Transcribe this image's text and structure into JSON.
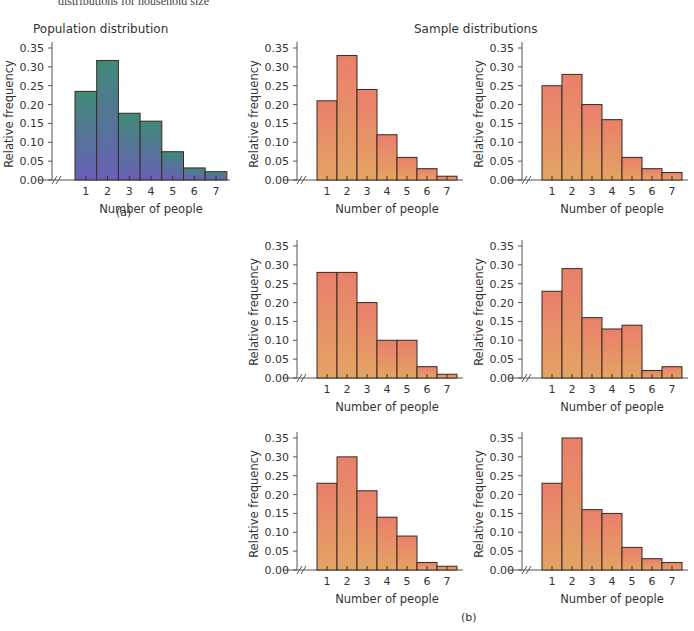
{
  "header": {
    "caption_fragment": "distributions for household size",
    "population_title": "Population distribution",
    "sample_title": "Sample distributions",
    "label_a": "(a)",
    "label_b": "(b)"
  },
  "colors": {
    "population_top": "#3f8a78",
    "population_bottom": "#6a5fb8",
    "sample_top": "#ea7f6c",
    "sample_bottom": "#e3a463",
    "bar_stroke": "#3a2a22",
    "axis": "#555555"
  },
  "chart_data": [
    {
      "id": "population",
      "type": "bar",
      "title": "Population distribution",
      "xlabel": "Number of people",
      "ylabel": "Relative frequency",
      "categories": [
        "1",
        "2",
        "3",
        "4",
        "5",
        "6",
        "7"
      ],
      "values": [
        0.235,
        0.317,
        0.177,
        0.156,
        0.075,
        0.032,
        0.022
      ],
      "yticks": [
        "0.00",
        "0.05",
        "0.10",
        "0.15",
        "0.20",
        "0.25",
        "0.30",
        "0.35"
      ],
      "ylim": [
        0,
        0.35
      ],
      "grid": false,
      "axis_break": true
    },
    {
      "id": "sample-1",
      "type": "bar",
      "xlabel": "Number of people",
      "ylabel": "Relative frequency",
      "categories": [
        "1",
        "2",
        "3",
        "4",
        "5",
        "6",
        "7"
      ],
      "values": [
        0.21,
        0.33,
        0.24,
        0.12,
        0.06,
        0.03,
        0.01
      ],
      "yticks": [
        "0.00",
        "0.05",
        "0.10",
        "0.15",
        "0.20",
        "0.25",
        "0.30",
        "0.35"
      ],
      "ylim": [
        0,
        0.35
      ],
      "grid": false,
      "axis_break": true
    },
    {
      "id": "sample-2",
      "type": "bar",
      "xlabel": "Number of people",
      "ylabel": "Relative frequency",
      "categories": [
        "1",
        "2",
        "3",
        "4",
        "5",
        "6",
        "7"
      ],
      "values": [
        0.25,
        0.28,
        0.2,
        0.16,
        0.06,
        0.03,
        0.02
      ],
      "yticks": [
        "0.00",
        "0.05",
        "0.10",
        "0.15",
        "0.20",
        "0.25",
        "0.30",
        "0.35"
      ],
      "ylim": [
        0,
        0.35
      ],
      "grid": false,
      "axis_break": true
    },
    {
      "id": "sample-3",
      "type": "bar",
      "xlabel": "Number of people",
      "ylabel": "Relative frequency",
      "categories": [
        "1",
        "2",
        "3",
        "4",
        "5",
        "6",
        "7"
      ],
      "values": [
        0.28,
        0.28,
        0.2,
        0.1,
        0.1,
        0.03,
        0.01
      ],
      "yticks": [
        "0.00",
        "0.05",
        "0.10",
        "0.15",
        "0.20",
        "0.25",
        "0.30",
        "0.35"
      ],
      "ylim": [
        0,
        0.35
      ],
      "grid": false,
      "axis_break": true
    },
    {
      "id": "sample-4",
      "type": "bar",
      "xlabel": "Number of people",
      "ylabel": "Relative frequency",
      "categories": [
        "1",
        "2",
        "3",
        "4",
        "5",
        "6",
        "7"
      ],
      "values": [
        0.23,
        0.29,
        0.16,
        0.13,
        0.14,
        0.02,
        0.03
      ],
      "yticks": [
        "0.00",
        "0.05",
        "0.10",
        "0.15",
        "0.20",
        "0.25",
        "0.30",
        "0.35"
      ],
      "ylim": [
        0,
        0.35
      ],
      "grid": false,
      "axis_break": true
    },
    {
      "id": "sample-5",
      "type": "bar",
      "xlabel": "Number of people",
      "ylabel": "Relative frequency",
      "categories": [
        "1",
        "2",
        "3",
        "4",
        "5",
        "6",
        "7"
      ],
      "values": [
        0.23,
        0.3,
        0.21,
        0.14,
        0.09,
        0.02,
        0.01
      ],
      "yticks": [
        "0.00",
        "0.05",
        "0.10",
        "0.15",
        "0.20",
        "0.25",
        "0.30",
        "0.35"
      ],
      "ylim": [
        0,
        0.35
      ],
      "grid": false,
      "axis_break": true
    },
    {
      "id": "sample-6",
      "type": "bar",
      "xlabel": "Number of people",
      "ylabel": "Relative frequency",
      "categories": [
        "1",
        "2",
        "3",
        "4",
        "5",
        "6",
        "7"
      ],
      "values": [
        0.23,
        0.35,
        0.16,
        0.15,
        0.06,
        0.03,
        0.02
      ],
      "yticks": [
        "0.00",
        "0.05",
        "0.10",
        "0.15",
        "0.20",
        "0.25",
        "0.30",
        "0.35"
      ],
      "ylim": [
        0,
        0.35
      ],
      "grid": false,
      "axis_break": true
    }
  ],
  "layout": [
    {
      "left": 0,
      "top": 38,
      "variant": "population"
    },
    {
      "left": 245,
      "top": 38,
      "variant": "sample"
    },
    {
      "left": 470,
      "top": 38,
      "variant": "sample"
    },
    {
      "left": 245,
      "top": 236,
      "variant": "sample"
    },
    {
      "left": 470,
      "top": 236,
      "variant": "sample"
    },
    {
      "left": 245,
      "top": 428,
      "variant": "sample"
    },
    {
      "left": 470,
      "top": 428,
      "variant": "sample"
    }
  ]
}
